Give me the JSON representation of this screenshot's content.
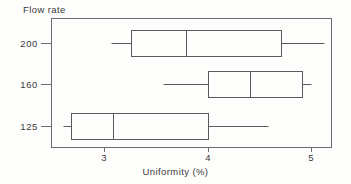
{
  "chart_data": {
    "type": "box",
    "title": "",
    "xlabel": "Uniformity (%)",
    "ylabel": "Flow rate",
    "xlim": [
      2.5,
      5.15
    ],
    "xticks": [
      3,
      4,
      5
    ],
    "xtick_labels": [
      "3",
      "4",
      "5"
    ],
    "categories": [
      "200",
      "160",
      "125"
    ],
    "grid": false,
    "legend": null,
    "orientation": "horizontal",
    "boxes": [
      {
        "category": "200",
        "whisker_low": 3.07,
        "q1": 3.26,
        "median": 3.79,
        "q3": 4.71,
        "whisker_high": 5.13
      },
      {
        "category": "160",
        "whisker_low": 3.57,
        "q1": 4.0,
        "median": 4.41,
        "q3": 4.91,
        "whisker_high": 5.0
      },
      {
        "category": "125",
        "whisker_low": 2.6,
        "q1": 2.68,
        "median": 3.09,
        "q3": 4.0,
        "whisker_high": 4.58
      }
    ]
  },
  "labels": {
    "flow_rate_title": "Flow rate",
    "x_axis_title": "Uniformity (%)",
    "ytick_200": "200",
    "ytick_160": "160",
    "ytick_125": "125",
    "xtick_3": "3",
    "xtick_4": "4",
    "xtick_5": "5"
  },
  "colors": {
    "background": "#fdfdfc",
    "frame": "#6d6d6d",
    "box_stroke": "#5b5b5b",
    "text": "#3a3a3a"
  }
}
